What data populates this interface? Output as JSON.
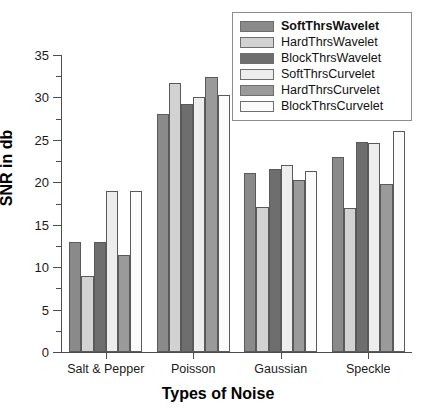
{
  "chart_data": {
    "type": "bar",
    "title": "",
    "xlabel": "Types of Noise",
    "ylabel": "SNR in db",
    "ylim": [
      0,
      35
    ],
    "ytick_step": 5,
    "yminor_step": 2.5,
    "grid": false,
    "legend_position": "top-right",
    "categories": [
      "Salt & Pepper",
      "Poisson",
      "Gaussian",
      "Speckle"
    ],
    "ytick_labels": [
      "0",
      "5",
      "10",
      "15",
      "20",
      "25",
      "30",
      "35"
    ],
    "series": [
      {
        "name": "SoftThrsWavelet",
        "color": "#8a8a8a",
        "values": [
          13.0,
          28.0,
          21.1,
          23.0
        ]
      },
      {
        "name": "HardThrsWavelet",
        "color": "#d2d2d2",
        "values": [
          9.0,
          31.7,
          17.1,
          17.0
        ]
      },
      {
        "name": "BlockThrsWavelet",
        "color": "#6e6e6e",
        "values": [
          13.0,
          29.2,
          21.6,
          24.8
        ]
      },
      {
        "name": "SoftThrsCurvelet",
        "color": "#ededed",
        "values": [
          19.0,
          30.0,
          22.0,
          24.6
        ]
      },
      {
        "name": "HardThrsCurvelet",
        "color": "#9a9a9a",
        "values": [
          11.4,
          32.4,
          20.3,
          19.8
        ]
      },
      {
        "name": "BlockThrsCurvelet",
        "color": "#fbfbfb",
        "values": [
          19.0,
          30.3,
          21.3,
          26.0
        ]
      }
    ]
  },
  "legend": {
    "items": [
      "SoftThrsWavelet",
      "HardThrsWavelet",
      "BlockThrsWavelet",
      "SoftThrsCurvelet",
      "HardThrsCurvelet",
      "BlockThrsCurvelet"
    ]
  },
  "axes": {
    "y_title": "SNR in db",
    "x_title": "Types of Noise"
  }
}
